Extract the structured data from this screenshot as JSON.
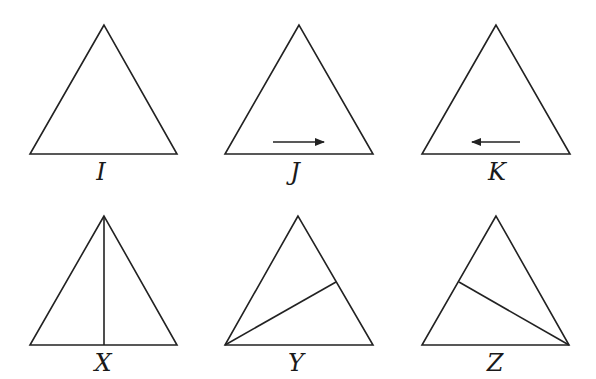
{
  "figures": [
    {
      "label": "I",
      "apex": [
        104,
        25
      ],
      "left": [
        30,
        154
      ],
      "right": [
        177,
        154
      ],
      "extra": "none",
      "label_pos": [
        101,
        160
      ]
    },
    {
      "label": "J",
      "apex": [
        299,
        25
      ],
      "left": [
        225,
        154
      ],
      "right": [
        373,
        154
      ],
      "extra": "arrow-right",
      "arrow": {
        "from": [
          273,
          142
        ],
        "to": [
          324,
          142
        ]
      },
      "label_pos": [
        295,
        160
      ]
    },
    {
      "label": "K",
      "apex": [
        496,
        25
      ],
      "left": [
        422,
        154
      ],
      "right": [
        570,
        154
      ],
      "extra": "arrow-left",
      "arrow": {
        "from": [
          520,
          142
        ],
        "to": [
          472,
          142
        ]
      },
      "label_pos": [
        497,
        160
      ]
    },
    {
      "label": "X",
      "apex": [
        104,
        216
      ],
      "left": [
        30,
        345
      ],
      "right": [
        177,
        345
      ],
      "extra": "segment",
      "segment": {
        "from": [
          104,
          216
        ],
        "to": [
          104,
          345
        ]
      },
      "label_pos": [
        103,
        351
      ]
    },
    {
      "label": "Y",
      "apex": [
        298,
        216
      ],
      "left": [
        225,
        345
      ],
      "right": [
        373,
        345
      ],
      "extra": "segment",
      "segment": {
        "from": [
          225,
          345
        ],
        "to": [
          336,
          282
        ]
      },
      "label_pos": [
        296,
        351
      ]
    },
    {
      "label": "Z",
      "apex": [
        496,
        216
      ],
      "left": [
        422,
        345
      ],
      "right": [
        569,
        345
      ],
      "extra": "segment",
      "segment": {
        "from": [
          569,
          345
        ],
        "to": [
          459,
          282
        ]
      },
      "label_pos": [
        495,
        351
      ]
    }
  ],
  "colors": {
    "stroke": "#222222",
    "background": "#ffffff"
  }
}
